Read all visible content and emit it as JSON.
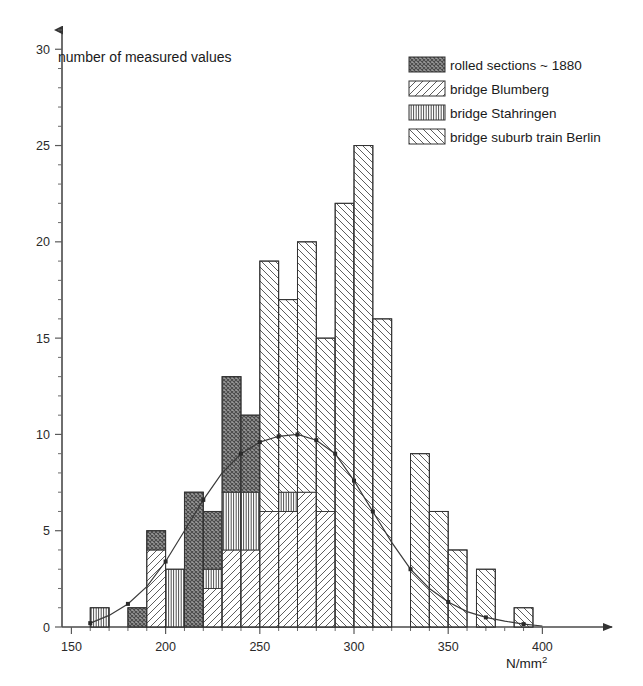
{
  "chart_data": {
    "type": "bar",
    "title": "",
    "ylabel": "number of measured values",
    "xlabel": "N/mm",
    "xlabel_sup": "2",
    "xlim": [
      145,
      412
    ],
    "ylim": [
      0,
      31
    ],
    "xticks": [
      150,
      200,
      250,
      300,
      350,
      400
    ],
    "xtick_minor_step": 10,
    "yticks": [
      0,
      5,
      10,
      15,
      20,
      25,
      30
    ],
    "ytick_minor_step": 1,
    "grid": false,
    "bin_width": 10,
    "legend_position": "top-right",
    "series": [
      {
        "name": "rolled sections ~ 1880",
        "key": "rolled",
        "pattern": "dense-stipple"
      },
      {
        "name": "bridge Blumberg",
        "key": "blumberg",
        "pattern": "diagonal-forward"
      },
      {
        "name": "bridge Stahringen",
        "key": "stahringen",
        "pattern": "vertical"
      },
      {
        "name": "bridge suburb train Berlin",
        "key": "berlin",
        "pattern": "diagonal-back"
      }
    ],
    "bins": [
      {
        "x0": 160,
        "x1": 170,
        "total": 1,
        "segments": [
          {
            "key": "stahringen",
            "value": 1
          }
        ]
      },
      {
        "x0": 180,
        "x1": 190,
        "total": 1,
        "segments": [
          {
            "key": "rolled",
            "value": 1
          }
        ]
      },
      {
        "x0": 190,
        "x1": 200,
        "total": 5,
        "segments": [
          {
            "key": "blumberg",
            "value": 4
          },
          {
            "key": "rolled",
            "value": 1
          }
        ]
      },
      {
        "x0": 200,
        "x1": 210,
        "total": 3,
        "segments": [
          {
            "key": "stahringen",
            "value": 3
          }
        ]
      },
      {
        "x0": 210,
        "x1": 220,
        "total": 7,
        "segments": [
          {
            "key": "rolled",
            "value": 7
          }
        ]
      },
      {
        "x0": 220,
        "x1": 230,
        "total": 6,
        "segments": [
          {
            "key": "blumberg",
            "value": 2
          },
          {
            "key": "stahringen",
            "value": 1
          },
          {
            "key": "rolled",
            "value": 3
          }
        ]
      },
      {
        "x0": 230,
        "x1": 240,
        "total": 13,
        "segments": [
          {
            "key": "blumberg",
            "value": 4
          },
          {
            "key": "stahringen",
            "value": 3
          },
          {
            "key": "rolled",
            "value": 6
          }
        ]
      },
      {
        "x0": 240,
        "x1": 250,
        "total": 11,
        "segments": [
          {
            "key": "blumberg",
            "value": 4
          },
          {
            "key": "stahringen",
            "value": 3
          },
          {
            "key": "rolled",
            "value": 4
          }
        ]
      },
      {
        "x0": 250,
        "x1": 260,
        "total": 19,
        "segments": [
          {
            "key": "blumberg",
            "value": 6
          },
          {
            "key": "berlin",
            "value": 13
          }
        ]
      },
      {
        "x0": 260,
        "x1": 270,
        "total": 17,
        "segments": [
          {
            "key": "blumberg",
            "value": 6
          },
          {
            "key": "stahringen",
            "value": 1
          },
          {
            "key": "berlin",
            "value": 10
          }
        ]
      },
      {
        "x0": 270,
        "x1": 280,
        "total": 20,
        "segments": [
          {
            "key": "blumberg",
            "value": 7
          },
          {
            "key": "berlin",
            "value": 13
          }
        ]
      },
      {
        "x0": 280,
        "x1": 290,
        "total": 15,
        "segments": [
          {
            "key": "blumberg",
            "value": 6
          },
          {
            "key": "berlin",
            "value": 9
          }
        ]
      },
      {
        "x0": 290,
        "x1": 300,
        "total": 22,
        "segments": [
          {
            "key": "berlin",
            "value": 22
          }
        ]
      },
      {
        "x0": 300,
        "x1": 310,
        "total": 25,
        "segments": [
          {
            "key": "berlin",
            "value": 25
          }
        ]
      },
      {
        "x0": 310,
        "x1": 320,
        "total": 16,
        "segments": [
          {
            "key": "berlin",
            "value": 16
          }
        ]
      },
      {
        "x0": 330,
        "x1": 340,
        "total": 9,
        "segments": [
          {
            "key": "berlin",
            "value": 9
          }
        ]
      },
      {
        "x0": 340,
        "x1": 350,
        "total": 6,
        "segments": [
          {
            "key": "berlin",
            "value": 6
          }
        ]
      },
      {
        "x0": 350,
        "x1": 360,
        "total": 4,
        "segments": [
          {
            "key": "berlin",
            "value": 4
          }
        ]
      },
      {
        "x0": 365,
        "x1": 375,
        "total": 3,
        "segments": [
          {
            "key": "berlin",
            "value": 3
          }
        ]
      },
      {
        "x0": 385,
        "x1": 395,
        "total": 1,
        "segments": [
          {
            "key": "berlin",
            "value": 1
          }
        ]
      }
    ],
    "fit_curve": {
      "label": "normal distribution fit",
      "points": [
        {
          "x": 160,
          "y": 0.2
        },
        {
          "x": 170,
          "y": 0.6
        },
        {
          "x": 180,
          "y": 1.2
        },
        {
          "x": 190,
          "y": 2.1
        },
        {
          "x": 200,
          "y": 3.4
        },
        {
          "x": 210,
          "y": 5.0
        },
        {
          "x": 220,
          "y": 6.6
        },
        {
          "x": 230,
          "y": 8.0
        },
        {
          "x": 240,
          "y": 9.0
        },
        {
          "x": 250,
          "y": 9.6
        },
        {
          "x": 260,
          "y": 9.9
        },
        {
          "x": 270,
          "y": 10.0
        },
        {
          "x": 280,
          "y": 9.7
        },
        {
          "x": 290,
          "y": 9.0
        },
        {
          "x": 300,
          "y": 7.6
        },
        {
          "x": 310,
          "y": 6.0
        },
        {
          "x": 320,
          "y": 4.4
        },
        {
          "x": 330,
          "y": 3.0
        },
        {
          "x": 340,
          "y": 2.0
        },
        {
          "x": 350,
          "y": 1.3
        },
        {
          "x": 360,
          "y": 0.8
        },
        {
          "x": 370,
          "y": 0.5
        },
        {
          "x": 380,
          "y": 0.3
        },
        {
          "x": 390,
          "y": 0.15
        },
        {
          "x": 400,
          "y": 0.05
        }
      ],
      "marked_points": [
        160,
        180,
        200,
        220,
        240,
        250,
        260,
        270,
        280,
        290,
        300,
        310,
        330,
        350,
        370,
        390
      ]
    },
    "colors": {
      "axis": "#4a4a4a",
      "outline": "#333333",
      "curve": "#3a3a3a",
      "rolled_fill": "#8f8f8f",
      "hatch": "#555555",
      "text": "#1a1a1a"
    }
  },
  "legend": {
    "items": [
      {
        "label": "rolled sections ~ 1880",
        "pattern": "dense-stipple"
      },
      {
        "label": "bridge Blumberg",
        "pattern": "diagonal-forward"
      },
      {
        "label": "bridge Stahringen",
        "pattern": "vertical"
      },
      {
        "label": "bridge suburb train Berlin",
        "pattern": "diagonal-back"
      }
    ]
  }
}
